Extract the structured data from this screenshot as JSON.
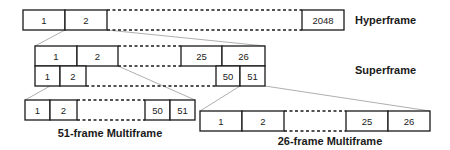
{
  "diagram": {
    "hyperframe": {
      "label": "Hyperframe",
      "cells": [
        "1",
        "2",
        "2048"
      ]
    },
    "superframe": {
      "label": "Superframe",
      "row1_cells": [
        "1",
        "2",
        "25",
        "26"
      ],
      "row2_cells": [
        "1",
        "2",
        "50",
        "51"
      ]
    },
    "multiframe51": {
      "label": "51-frame Multiframe",
      "cells": [
        "1",
        "2",
        "50",
        "51"
      ]
    },
    "multiframe26": {
      "label": "26-frame Multiframe",
      "cells": [
        "1",
        "2",
        "25",
        "26"
      ]
    }
  }
}
